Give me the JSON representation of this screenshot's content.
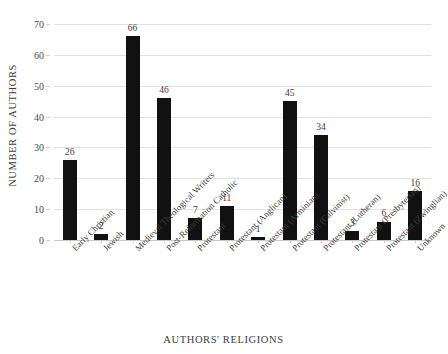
{
  "chart_data": {
    "type": "bar",
    "title": "",
    "xlabel": "AUTHORS' RELIGIONS",
    "ylabel": "NUMBER OF AUTHORS",
    "categories": [
      "Early Christian",
      "Jewish",
      "Medieval Theological Writers",
      "Post-Reformation Catholic",
      "Protestant",
      "Protestant (Anglican)",
      "Protestant (Arminian)",
      "Protestant (Calvinist)",
      "Protestant (Lutheran)",
      "Protestant (Presbyterian)",
      "Protestant (Zwinglian)",
      "Unknown"
    ],
    "values": [
      26,
      2,
      66,
      46,
      7,
      11,
      1,
      45,
      34,
      3,
      6,
      16
    ],
    "value_labels": [
      "26",
      "2",
      "66",
      "46",
      "7",
      "11",
      "1",
      "45",
      "34",
      "3",
      "6",
      "16"
    ],
    "ylim": [
      0,
      70
    ],
    "ytick_labels": [
      "0",
      "10",
      "20",
      "30",
      "40",
      "50",
      "60",
      "70"
    ],
    "ytick_values": [
      0,
      10,
      20,
      30,
      40,
      50,
      60,
      70
    ],
    "grid": true,
    "grid_axis": "y",
    "legend": false,
    "bar_color": "#111111",
    "grid_color": "#e2e2e2",
    "text_color": "#3c3c3c",
    "background_color": "#ffffff"
  }
}
